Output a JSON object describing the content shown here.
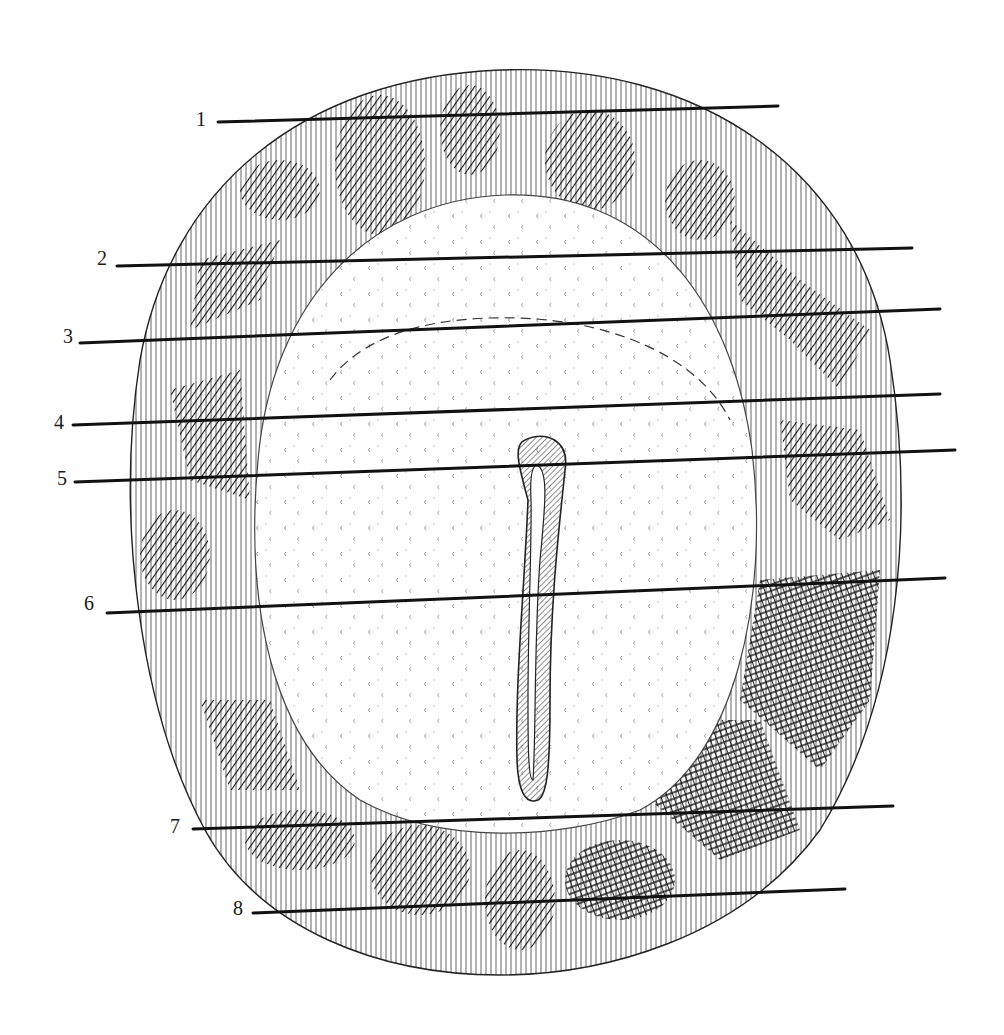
{
  "figure": {
    "type": "histological cross-section illustration",
    "colors": {
      "ink": "#111111",
      "background": "#ffffff",
      "hatch": "#2a2a2a"
    },
    "labels": [
      {
        "num": "1",
        "text_x": 205,
        "text_y": 124,
        "x1": 218,
        "y1": 122,
        "x2": 778,
        "y2": 106
      },
      {
        "num": "2",
        "text_x": 104,
        "text_y": 262,
        "x1": 117,
        "y1": 266,
        "x2": 912,
        "y2": 248
      },
      {
        "num": "3",
        "text_x": 70,
        "text_y": 341,
        "x1": 80,
        "y1": 343,
        "x2": 940,
        "y2": 309
      },
      {
        "num": "4",
        "text_x": 60,
        "text_y": 425,
        "x1": 73,
        "y1": 425,
        "x2": 940,
        "y2": 394
      },
      {
        "num": "5",
        "text_x": 63,
        "text_y": 481,
        "x1": 75,
        "y1": 482,
        "x2": 955,
        "y2": 450
      },
      {
        "num": "6",
        "text_x": 89,
        "text_y": 611,
        "x1": 107,
        "y1": 613,
        "x2": 945,
        "y2": 578
      },
      {
        "num": "7",
        "text_x": 172,
        "text_y": 833,
        "x1": 193,
        "y1": 829,
        "x2": 893,
        "y2": 806
      },
      {
        "num": "8",
        "text_x": 235,
        "text_y": 916,
        "x1": 253,
        "y1": 913,
        "x2": 845,
        "y2": 889
      }
    ]
  }
}
